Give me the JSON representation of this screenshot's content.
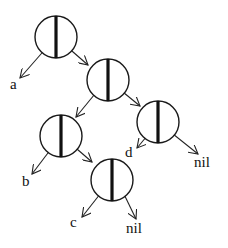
{
  "diagram": {
    "type": "linked-list-tree",
    "colors": {
      "stroke": "#1a1a1a",
      "background": "#ffffff"
    },
    "nodes": [
      {
        "id": "n1",
        "cx": 56,
        "cy": 37,
        "r": 21
      },
      {
        "id": "n2",
        "cx": 108,
        "cy": 80,
        "r": 21
      },
      {
        "id": "n3",
        "cx": 158,
        "cy": 122,
        "r": 21
      },
      {
        "id": "n4",
        "cx": 61,
        "cy": 136,
        "r": 21
      },
      {
        "id": "n5",
        "cx": 112,
        "cy": 180,
        "r": 21
      }
    ],
    "edges": [
      {
        "from": "n1",
        "side": "left",
        "x1": 48,
        "y1": 46,
        "x2": 20,
        "y2": 78
      },
      {
        "from": "n1",
        "side": "right",
        "x1": 65,
        "y1": 45,
        "x2": 88,
        "y2": 65
      },
      {
        "from": "n2",
        "side": "left",
        "x1": 99,
        "y1": 89,
        "x2": 76,
        "y2": 117
      },
      {
        "from": "n2",
        "side": "right",
        "x1": 118,
        "y1": 88,
        "x2": 140,
        "y2": 106
      },
      {
        "from": "n3",
        "side": "left",
        "x1": 152,
        "y1": 130,
        "x2": 137,
        "y2": 148
      },
      {
        "from": "n3",
        "side": "right",
        "x1": 168,
        "y1": 130,
        "x2": 198,
        "y2": 154
      },
      {
        "from": "n4",
        "side": "left",
        "x1": 54,
        "y1": 145,
        "x2": 32,
        "y2": 174
      },
      {
        "from": "n4",
        "side": "right",
        "x1": 70,
        "y1": 143,
        "x2": 92,
        "y2": 162
      },
      {
        "from": "n5",
        "side": "left",
        "x1": 104,
        "y1": 189,
        "x2": 82,
        "y2": 217
      },
      {
        "from": "n5",
        "side": "right",
        "x1": 121,
        "y1": 188,
        "x2": 136,
        "y2": 219
      }
    ],
    "labels": [
      {
        "id": "a",
        "text": "a",
        "x": 10,
        "y": 89
      },
      {
        "id": "b",
        "text": "b",
        "x": 22,
        "y": 186
      },
      {
        "id": "c",
        "text": "c",
        "x": 70,
        "y": 227
      },
      {
        "id": "d",
        "text": "d",
        "x": 125,
        "y": 157
      },
      {
        "id": "nil1",
        "text": "nil",
        "x": 194,
        "y": 167
      },
      {
        "id": "nil2",
        "text": "nil",
        "x": 126,
        "y": 233
      }
    ]
  }
}
